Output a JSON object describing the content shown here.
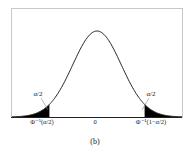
{
  "chart_data": {
    "type": "area",
    "title": "",
    "subtitle": "",
    "caption": "(b)",
    "xlabel": "",
    "ylabel": "",
    "curve": "standard normal pdf",
    "x_range": [
      -3.5,
      3.5
    ],
    "grid": false,
    "legend": null,
    "tick_labels": [
      "Φ⁻¹(α/2)",
      "0",
      "Φ⁻¹(1−α/2)"
    ],
    "shaded_regions": [
      {
        "name": "left-tail",
        "from": "-inf",
        "to": "Φ⁻¹(α/2)",
        "area_label": "α/2",
        "x_cut": -1.96
      },
      {
        "name": "right-tail",
        "from": "Φ⁻¹(1−α/2)",
        "to": "inf",
        "area_label": "α/2",
        "x_cut": 1.96
      }
    ],
    "annotations": [
      "α/2",
      "α/2"
    ]
  },
  "labels": {
    "left_tail": "α/2",
    "right_tail": "α/2",
    "tick_left": "Φ⁻¹(α/2)",
    "tick_center": "0",
    "tick_right": "Φ⁻¹(1−α/2)",
    "caption": "(b)"
  },
  "colors": {
    "curve": "#222222",
    "fill": "#000000",
    "frame": "#bbbbbb"
  }
}
